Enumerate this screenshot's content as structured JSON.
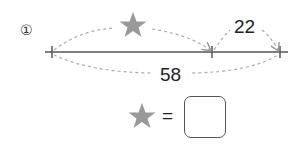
{
  "problem": {
    "number_label": "①",
    "segment_part_label": "22",
    "segment_total_label": "58",
    "unknown_symbol": "star",
    "equals": "=",
    "answer_value": ""
  },
  "colors": {
    "star": "#999999",
    "line": "#555555",
    "dashed_arc": "#aaaaaa",
    "text": "#222222"
  }
}
